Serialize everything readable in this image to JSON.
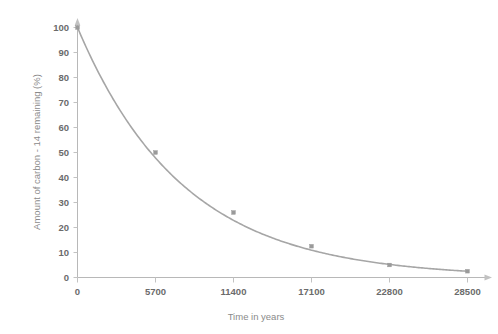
{
  "chart_data": {
    "type": "line",
    "title": "",
    "subtitle": "",
    "xlabel": "Time in years",
    "ylabel": "Amount of carbon - 14 remaining  (%)",
    "x": [
      0,
      5700,
      11400,
      17100,
      22800,
      28500
    ],
    "values": [
      100,
      50,
      26,
      12.5,
      5,
      2.5
    ],
    "series": [
      {
        "name": "Carbon-14 remaining",
        "x": [
          0,
          5700,
          11400,
          17100,
          22800,
          28500
        ],
        "values": [
          100,
          50,
          26,
          12.5,
          5,
          2.5
        ]
      }
    ],
    "xticks": [
      0,
      5700,
      11400,
      17100,
      22800,
      28500
    ],
    "xtick_labels": [
      "0",
      "5700",
      "11400",
      "17100",
      "22800",
      "28500"
    ],
    "yticks": [
      0,
      10,
      20,
      30,
      40,
      50,
      60,
      70,
      80,
      90,
      100
    ],
    "ytick_labels": [
      "0",
      "10",
      "20",
      "30",
      "40",
      "50",
      "60",
      "70",
      "80",
      "90",
      "100"
    ],
    "xlim": [
      0,
      28500
    ],
    "ylim": [
      0,
      100
    ],
    "grid": false,
    "legend": false,
    "legend_position": "none",
    "line_color": "#a6a6a6",
    "marker_color": "#9a9a9a",
    "axis_color": "#b8b8b8",
    "tick_label_color": "#6b6b6b",
    "axis_title_color": "#8a8a8a",
    "background_color": "#ffffff",
    "annotations": []
  },
  "axes": {
    "x_title": "Time in years",
    "y_title": "Amount of carbon - 14 remaining  (%)"
  },
  "xticks": {
    "0": "0",
    "1": "5700",
    "2": "11400",
    "3": "17100",
    "4": "22800",
    "5": "28500"
  },
  "yticks": {
    "0": "100",
    "1": "90",
    "2": "80",
    "3": "70",
    "4": "60",
    "5": "50",
    "6": "40",
    "7": "30",
    "8": "20",
    "9": "10",
    "10": "0"
  }
}
